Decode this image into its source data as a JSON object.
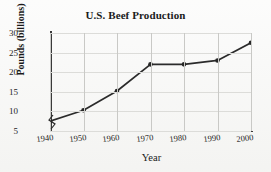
{
  "chart_data": {
    "type": "line",
    "title": "U.S. Beef Production",
    "xlabel": "Year",
    "ylabel": "Pounds (billions)",
    "x": [
      1940,
      1950,
      1960,
      1970,
      1980,
      1990,
      2000
    ],
    "categories": [
      "1940",
      "1950",
      "1960",
      "1970",
      "1980",
      "1990",
      "2000"
    ],
    "values": [
      7.5,
      10.3,
      15.2,
      22.0,
      22.0,
      23.0,
      27.5
    ],
    "series": [
      {
        "name": "U.S. Beef Production",
        "values": [
          7.5,
          10.3,
          15.2,
          22.0,
          22.0,
          23.0,
          27.5
        ]
      }
    ],
    "xlim": [
      1940,
      2000
    ],
    "ylim": [
      5,
      30
    ],
    "yticks": [
      5,
      10,
      15,
      20,
      25,
      30
    ],
    "ytick_labels": [
      "5",
      "10",
      "15",
      "20",
      "25",
      "30"
    ],
    "xticks": [
      1940,
      1950,
      1960,
      1970,
      1980,
      1990,
      2000
    ],
    "xtick_labels": [
      "1940",
      "1950",
      "1960",
      "1970",
      "1980",
      "1990",
      "2000"
    ],
    "grid": true,
    "grid_axis": "both",
    "legend": false,
    "legend_position": "none",
    "axis_break": {
      "axis": "y",
      "present": true,
      "below_value": "5",
      "symbol": "zigzag"
    },
    "marker": "filled-circle",
    "line_color": "#2b2b2b",
    "marker_color": "#262626",
    "grid_color": "#c9c9c6",
    "background_color": "#f3f3f1"
  },
  "figure": {
    "title": "U.S. Beef Production",
    "xlabel": "Year",
    "ylabel": "Pounds (billions)"
  }
}
